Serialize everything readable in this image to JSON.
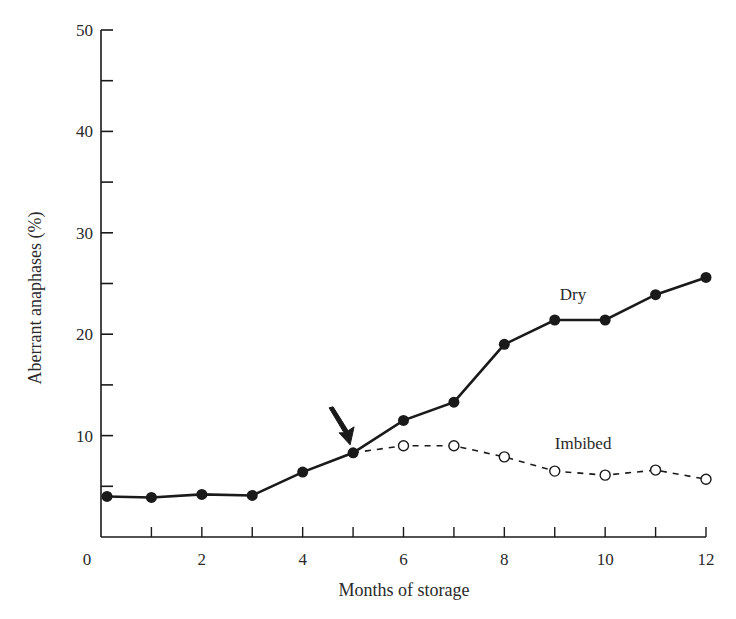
{
  "chart_data": {
    "type": "line",
    "title": "",
    "xlabel": "Months of storage",
    "ylabel": "Aberrant anaphases (%)",
    "xlim": [
      0,
      12
    ],
    "ylim": [
      0,
      50
    ],
    "xticks_major": [
      0,
      2,
      4,
      6,
      8,
      10,
      12
    ],
    "xticks_minor": [
      1,
      3,
      5,
      7,
      9,
      11
    ],
    "yticks_major": [
      10,
      20,
      30,
      40,
      50
    ],
    "yticks_minor": [
      5,
      15,
      25,
      35,
      45
    ],
    "xtick_labels": [
      "0",
      "2",
      "4",
      "6",
      "8",
      "10",
      "12"
    ],
    "ytick_labels": [
      "10",
      "20",
      "30",
      "40",
      "50"
    ],
    "grid": false,
    "legend": "inline labels next to lines",
    "series": [
      {
        "name": "Dry",
        "marker": "filled-circle",
        "line": "solid",
        "x": [
          0,
          1,
          2,
          3,
          4,
          5,
          6,
          7,
          8,
          9,
          10,
          11,
          12
        ],
        "values": [
          4.0,
          3.9,
          4.2,
          4.1,
          6.4,
          8.3,
          11.5,
          13.3,
          19.0,
          21.4,
          21.4,
          23.9,
          25.6
        ],
        "label_pos": [
          9.1,
          23.4
        ]
      },
      {
        "name": "Imbibed",
        "marker": "open-circle",
        "line": "dashed",
        "x": [
          5,
          6,
          7,
          8,
          9,
          10,
          11,
          12
        ],
        "values": [
          8.3,
          9.0,
          9.0,
          7.9,
          6.5,
          6.1,
          6.6,
          5.7
        ],
        "label_pos": [
          9.0,
          8.7
        ]
      }
    ],
    "annotations": [
      {
        "type": "arrow",
        "points_to": [
          5,
          8.3
        ],
        "meaning": "point where imbibed treatment begins"
      }
    ]
  }
}
